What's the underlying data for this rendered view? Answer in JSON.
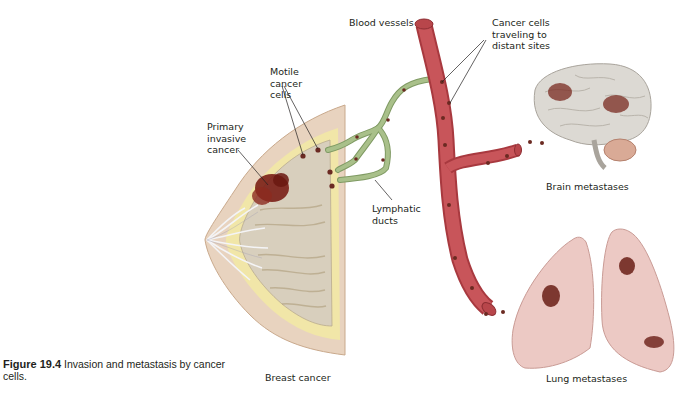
{
  "figure": {
    "number": "Figure 19.4",
    "caption": "Invasion and metastasis by cancer cells."
  },
  "labels": {
    "blood_vessels": "Blood vessels",
    "cancer_cells_traveling": "Cancer cells\ntraveling to\ndistant sites",
    "motile_cancer_cells": "Motile\ncancer\ncells",
    "primary_invasive_cancer": "Primary\ninvasive\ncancer",
    "lymphatic_ducts": "Lymphatic\nducts",
    "brain_metastases": "Brain metastases",
    "lung_metastases": "Lung metastases",
    "breast_cancer": "Breast cancer"
  },
  "colors": {
    "blood_vessel": "#c8555a",
    "blood_vessel_dark": "#a8393f",
    "lymph_duct": "#a9c08a",
    "lymph_duct_dark": "#7f9a63",
    "cancer_cell": "#6b2a22",
    "tumor": "#7a1e16",
    "breast_skin": "#e8d3bf",
    "breast_fat": "#f1e6a8",
    "breast_tissue": "#d8cfbd",
    "brain": "#dcd9d3",
    "cerebellum": "#d9aa96",
    "lung": "#ecc9c4",
    "leader_line": "#231f20",
    "text": "#231f20"
  }
}
